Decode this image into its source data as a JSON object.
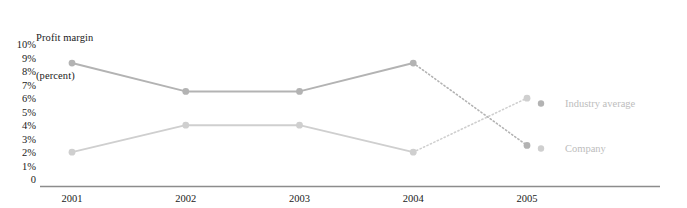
{
  "chart_data": {
    "type": "line",
    "title": "Profit margin (percent)",
    "title_lines": [
      "Profit margin",
      "(percent)"
    ],
    "xlabel": "",
    "ylabel": "Profit margin (percent)",
    "categories": [
      "2001",
      "2002",
      "2003",
      "2004",
      "2005"
    ],
    "x": [
      2001,
      2002,
      2003,
      2004,
      2005
    ],
    "ylim": [
      0,
      10
    ],
    "ytick_labels": [
      "10%",
      "9%",
      "8%",
      "7%",
      "6%",
      "5%",
      "4%",
      "3%",
      "2%",
      "1%",
      "0"
    ],
    "ytick_values": [
      10,
      9,
      8,
      7,
      6,
      5,
      4,
      3,
      2,
      1,
      0
    ],
    "grid": false,
    "legend_position": "right",
    "series": [
      {
        "name": "Industry average",
        "values": [
          8.7,
          6.6,
          6.6,
          8.7,
          2.6
        ],
        "color": "#b3b3b3",
        "marker": "circle",
        "dashed_from_index": 3,
        "dash_note": "2004-2005 segment dotted"
      },
      {
        "name": "Company",
        "values": [
          2.1,
          4.1,
          4.1,
          2.1,
          6.1
        ],
        "color": "#cfcfcf",
        "marker": "circle",
        "dashed_from_index": 3,
        "dash_note": "2004-2005 segment dotted"
      }
    ]
  },
  "legend": {
    "industry_average": "Industry average",
    "company": "Company"
  },
  "colors": {
    "industry": "#b3b3b3",
    "company": "#cfcfcf",
    "legend_text": "#bdbdbd",
    "axis_text": "#1a1a1a",
    "baseline": "#8c8c8c",
    "background": "#ffffff"
  }
}
